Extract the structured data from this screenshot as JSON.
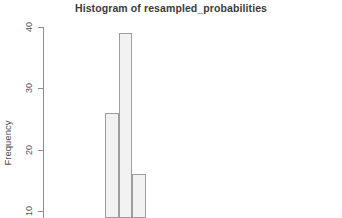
{
  "chart_data": {
    "type": "bar",
    "title": "Histogram of resampled_probabilities",
    "xlabel": "",
    "ylabel": "Frequency",
    "categories": [
      "bin-1",
      "bin-2",
      "bin-3"
    ],
    "values": [
      26,
      39,
      16
    ],
    "ylim": [
      0,
      40
    ],
    "yticks": [
      10,
      20,
      30,
      40
    ],
    "ytick_labels": [
      "10",
      "20",
      "30",
      "40"
    ],
    "grid": false,
    "legend": "none",
    "bar_fill": "#f2f2f2",
    "bar_border": "#9e9e9e",
    "axis_color": "#8c8c8c",
    "note": "plot is cropped at the bottom; x-axis and axis title are not visible"
  },
  "axis": {
    "tick_40": "40",
    "tick_30": "30",
    "tick_20": "20",
    "tick_10": "10"
  }
}
